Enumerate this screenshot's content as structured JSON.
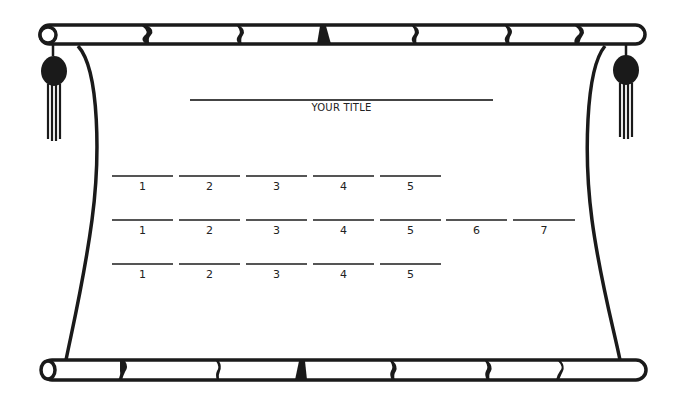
{
  "document": {
    "kind": "scroll-template",
    "title_label": "YOUR TITLE",
    "rows": [
      {
        "slots": [
          "1",
          "2",
          "3",
          "4",
          "5"
        ]
      },
      {
        "slots": [
          "1",
          "2",
          "3",
          "4",
          "5",
          "6",
          "7"
        ]
      },
      {
        "slots": [
          "1",
          "2",
          "3",
          "4",
          "5"
        ]
      }
    ]
  },
  "decorations": {
    "top_rod": "scroll-rod-icon",
    "bottom_rod": "scroll-rod-icon",
    "left_tassel": "tassel-icon",
    "right_tassel": "tassel-icon",
    "ink_color": "#1a1a1a",
    "paper_color": "#ffffff"
  }
}
